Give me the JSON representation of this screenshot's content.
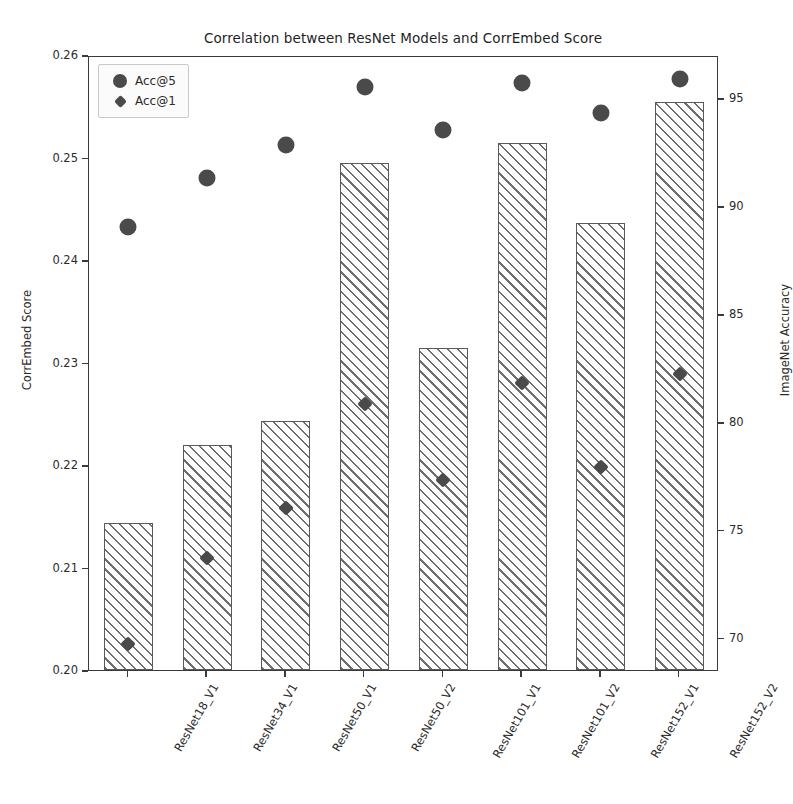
{
  "chart_data": {
    "type": "bar",
    "title": "Correlation between ResNet Models and CorrEmbed Score",
    "xlabel": "",
    "ylabel": "CorrEmbed Score",
    "ylabel_right": "ImageNet Accuracy",
    "categories": [
      "ResNet18_V1",
      "ResNet34_V1",
      "ResNet50_V1",
      "ResNet50_V2",
      "ResNet101_V1",
      "ResNet101_V2",
      "ResNet152_V1",
      "ResNet152_V2"
    ],
    "values": [
      0.2143,
      0.222,
      0.2243,
      0.2495,
      0.2314,
      0.2514,
      0.2436,
      0.2554
    ],
    "ylim": [
      0.2,
      0.26
    ],
    "yticks": [
      "0.20",
      "0.21",
      "0.22",
      "0.23",
      "0.24",
      "0.25",
      "0.26"
    ],
    "ytick_values": [
      0.2,
      0.21,
      0.22,
      0.23,
      0.24,
      0.25,
      0.26
    ],
    "ylim_right": [
      68.5,
      97.0
    ],
    "yticks_right": [
      "70",
      "75",
      "80",
      "85",
      "90",
      "95"
    ],
    "ytick_values_right": [
      70,
      75,
      80,
      85,
      90,
      95
    ],
    "grid": false,
    "legend_position": "upper left",
    "series": [
      {
        "name": "Acc@5",
        "marker": "circle",
        "axis": "right",
        "values": [
          89.1,
          91.4,
          92.9,
          95.6,
          93.6,
          95.8,
          94.4,
          96.0
        ]
      },
      {
        "name": "Acc@1",
        "marker": "diamond",
        "axis": "right",
        "values": [
          69.8,
          73.8,
          76.1,
          80.9,
          77.4,
          81.9,
          78.0,
          82.3
        ]
      }
    ],
    "colors": {
      "bar_edge": "#5a5a5a",
      "bar_hatch": "#6e6e6e",
      "marker": "#4a4a4a",
      "axis": "#3a3a3a",
      "background": "#ffffff"
    }
  }
}
